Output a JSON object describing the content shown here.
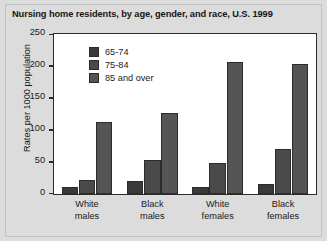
{
  "chart_data": {
    "type": "bar",
    "title": "Nursing home residents, by age, gender, and race, U.S. 1999",
    "xlabel": "",
    "ylabel": "Rates per 1000 population",
    "ylim": [
      0,
      250
    ],
    "yticks": [
      0,
      50,
      100,
      150,
      200,
      250
    ],
    "ytick_labels": [
      "0",
      "50",
      "100",
      "150",
      "200",
      "250"
    ],
    "grid": false,
    "legend_position": "upper-left-inside",
    "categories": [
      "White\nmales",
      "Black\nmales",
      "White\nfemales",
      "Black\nfemales"
    ],
    "category_labels": [
      {
        "line1": "White",
        "line2": "males"
      },
      {
        "line1": "Black",
        "line2": "males"
      },
      {
        "line1": "White",
        "line2": "females"
      },
      {
        "line1": "Black",
        "line2": "females"
      }
    ],
    "series": [
      {
        "name": "65-74",
        "color": "#3a3a3a",
        "values": [
          10,
          20,
          10,
          16
        ]
      },
      {
        "name": "75-84",
        "color": "#4a4a4a",
        "values": [
          21,
          53,
          48,
          70
        ]
      },
      {
        "name": "85 and over",
        "color": "#555555",
        "values": [
          113,
          127,
          207,
          203
        ]
      }
    ]
  },
  "figure": {
    "background_color": "#dcdcdc",
    "plot_background_color": "#ffffff",
    "axis_color": "#2b2b2b"
  }
}
